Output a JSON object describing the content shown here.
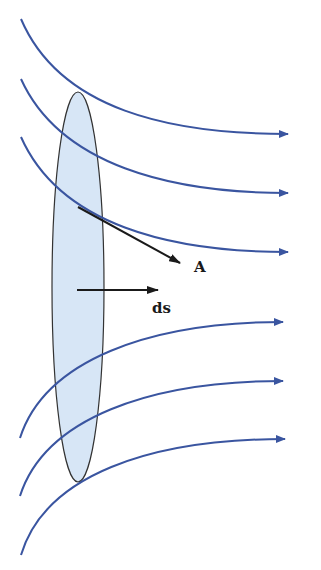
{
  "diagram": {
    "colors": {
      "field_lines": "#3a55a0",
      "surface_fill": "#d7e6f6",
      "surface_stroke": "#333333",
      "vectors": "#1a1a1a"
    },
    "labels": {
      "vector_a": "A",
      "area_element": "ds"
    },
    "field_lines": [
      {
        "d": "M21,19 C60,110 170,134 288,134"
      },
      {
        "d": "M21,79 C60,165 170,193 288,193"
      },
      {
        "d": "M21,137 C60,225 170,252 288,252"
      },
      {
        "d": "M20,438 C45,360 150,322 283,322"
      },
      {
        "d": "M20,496 C45,418 150,381 283,381"
      },
      {
        "d": "M21,555 C45,475 150,439 285,439"
      }
    ],
    "surface": {
      "cx": 78,
      "cy": 287,
      "rx": 26,
      "ry": 195
    }
  }
}
